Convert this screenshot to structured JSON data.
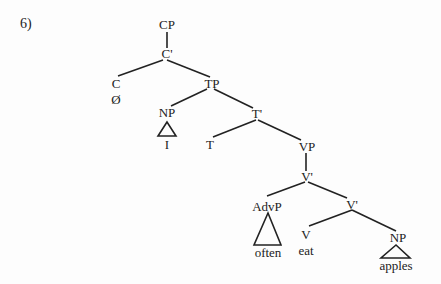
{
  "example_number": "6)",
  "nodes": {
    "cp": "CP",
    "c_bar": "C'",
    "c": "C",
    "c_null": "Ø",
    "tp": "TP",
    "np_subj": "NP",
    "subj": "I",
    "t_bar": "T'",
    "t": "T",
    "vp": "VP",
    "v_bar_upper": "V'",
    "advp": "AdvP",
    "adv": "often",
    "v_bar_lower": "V'",
    "v": "V",
    "verb": "eat",
    "np_obj": "NP",
    "obj": "apples"
  },
  "colors": {
    "line": "#222222",
    "text": "#222222"
  }
}
